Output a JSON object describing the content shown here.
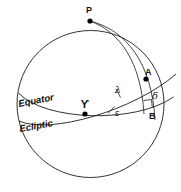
{
  "figure": {
    "background_color": "#ffffff",
    "ink_color": "#1b1b1b",
    "width": 181,
    "height": 192
  },
  "points": [
    {
      "id": "P",
      "label": "P",
      "meaning": "north-celestial-pole",
      "x": 90,
      "y": 21,
      "label_x": 89,
      "label_y": 11
    },
    {
      "id": "A",
      "label": "A",
      "meaning": "star-position",
      "x": 146,
      "y": 79,
      "label_x": 147,
      "label_y": 73
    },
    {
      "id": "B",
      "label": "B",
      "meaning": "foot-of-perpendicular-on-equator",
      "x": 152,
      "y": 110,
      "label_x": 152,
      "label_y": 116
    },
    {
      "id": "Y",
      "label": "ϒ",
      "meaning": "vernal-equinox-aries-point",
      "x": 85,
      "y": 114,
      "label_x": 83,
      "label_y": 107
    }
  ],
  "angles": [
    {
      "id": "lambda",
      "label": "λ",
      "meaning": "ecliptic-longitude",
      "label_x": 118,
      "label_y": 92
    },
    {
      "id": "epsilon",
      "label": "ε",
      "meaning": "obliquity-of-the-ecliptic",
      "label_x": 117,
      "label_y": 114
    },
    {
      "id": "delta",
      "label": "δ",
      "meaning": "declination",
      "label_x": 155,
      "label_y": 97
    }
  ],
  "curves": [
    {
      "id": "equator",
      "label": "Equator",
      "label_x": 20,
      "label_y": 105,
      "label_rotation": -12
    },
    {
      "id": "ecliptic",
      "label": "Ecliptic",
      "label_x": 21,
      "label_y": 130,
      "label_rotation": -11
    }
  ],
  "markers": {
    "right_angle": {
      "id": "right-angle-at-B",
      "meaning": "perpendicular-marker",
      "x": 144,
      "y": 100
    }
  }
}
